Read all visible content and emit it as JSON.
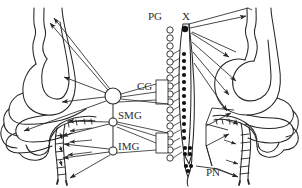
{
  "figure": {
    "background_color": "#ffffff",
    "stroke_color": "#262626",
    "label_color": "#2e2e2e",
    "width": 302,
    "height": 188
  },
  "labels": {
    "cg": "CG",
    "smg": "SMG",
    "img": "IMG",
    "pg": "PG",
    "x": "X",
    "pn": "PN"
  },
  "label_positions": {
    "cg": {
      "x": 137,
      "y": 90
    },
    "smg": {
      "x": 118,
      "y": 119
    },
    "img": {
      "x": 118,
      "y": 150
    },
    "pg": {
      "x": 148,
      "y": 20
    },
    "x": {
      "x": 182,
      "y": 20
    },
    "pn": {
      "x": 206,
      "y": 176
    }
  },
  "ganglia": {
    "celiac": {
      "name": "CG",
      "cx": 113,
      "cy": 96,
      "r": 8,
      "fill": "none"
    },
    "superior_mesenteric": {
      "name": "SMG",
      "cx": 113,
      "cy": 122,
      "r": 4,
      "fill": "none"
    },
    "inferior_mesenteric": {
      "name": "IMG",
      "cx": 113,
      "cy": 151,
      "r": 4,
      "fill": "none"
    }
  },
  "structures": {
    "left_panel": "sympathetic innervation: stomach, small intestine, colon",
    "right_panel": "parasympathetic innervation: stomach, small intestine, colon",
    "center": "spinal cord with sympathetic chain and prevertebral ganglia"
  },
  "chain": {
    "prevertebral_ganglia_count": 17,
    "cord_neuron_count": 17,
    "sacral_neuron_count": 3
  }
}
